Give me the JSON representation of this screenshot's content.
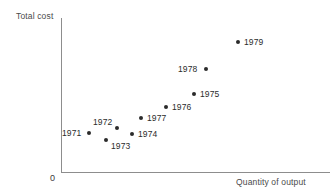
{
  "chart_data": {
    "type": "scatter",
    "title": "",
    "xlabel": "Quantity of output",
    "ylabel": "Total cost",
    "origin_label": "0",
    "grid": false,
    "legend": null,
    "axis_color": "#8d8d8d",
    "point_color": "#2b2b2b",
    "xlim": [
      0,
      1
    ],
    "ylim": [
      0,
      1
    ],
    "x_ticks": [],
    "y_ticks": [],
    "points": [
      {
        "label": "1971",
        "x_px": 89,
        "y_px": 133,
        "label_x_px": 62,
        "label_y_px": 129,
        "x": 0.104,
        "y": 0.253
      },
      {
        "label": "1972",
        "x_px": 117,
        "y_px": 128,
        "label_x_px": 93,
        "label_y_px": 118,
        "x": 0.208,
        "y": 0.286
      },
      {
        "label": "1973",
        "x_px": 106,
        "y_px": 140,
        "label_x_px": 111,
        "label_y_px": 142,
        "x": 0.167,
        "y": 0.208
      },
      {
        "label": "1974",
        "x_px": 132,
        "y_px": 134,
        "label_x_px": 138,
        "label_y_px": 130,
        "x": 0.264,
        "y": 0.247
      },
      {
        "label": "1975",
        "x_px": 194,
        "y_px": 94,
        "label_x_px": 200,
        "label_y_px": 90,
        "x": 0.494,
        "y": 0.506
      },
      {
        "label": "1976",
        "x_px": 166,
        "y_px": 107,
        "label_x_px": 172,
        "label_y_px": 103,
        "x": 0.39,
        "y": 0.422
      },
      {
        "label": "1977",
        "x_px": 141,
        "y_px": 118,
        "label_x_px": 147,
        "label_y_px": 114,
        "x": 0.297,
        "y": 0.351
      },
      {
        "label": "1978",
        "x_px": 206,
        "y_px": 69,
        "label_x_px": 178,
        "label_y_px": 65,
        "x": 0.539,
        "y": 0.669
      },
      {
        "label": "1979",
        "x_px": 238,
        "y_px": 42,
        "label_x_px": 244,
        "label_y_px": 38,
        "x": 0.658,
        "y": 0.844
      }
    ]
  }
}
